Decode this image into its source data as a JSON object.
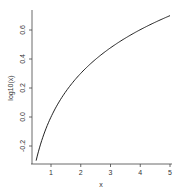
{
  "chart_data": {
    "type": "line",
    "title": "",
    "xlabel": "x",
    "ylabel": "log10(x)",
    "xlim": [
      0.5,
      5
    ],
    "ylim": [
      -0.301,
      0.699
    ],
    "x_ticks": [
      1,
      2,
      3,
      4,
      5
    ],
    "x_tick_labels": [
      "1",
      "2",
      "3",
      "4",
      "5"
    ],
    "y_ticks": [
      -0.2,
      0.0,
      0.2,
      0.4,
      0.6
    ],
    "y_tick_labels": [
      "-0.2",
      "0.0",
      "0.2",
      "0.4",
      "0.6"
    ],
    "grid": false,
    "legend": null,
    "series": [
      {
        "name": "log10(x)",
        "x": [
          0.5,
          0.6,
          0.7,
          0.8,
          0.9,
          1.0,
          1.25,
          1.5,
          1.75,
          2.0,
          2.5,
          3.0,
          3.5,
          4.0,
          4.5,
          5.0
        ],
        "values": [
          -0.301,
          -0.222,
          -0.155,
          -0.097,
          -0.046,
          0.0,
          0.097,
          0.176,
          0.243,
          0.301,
          0.398,
          0.477,
          0.544,
          0.602,
          0.653,
          0.699
        ]
      }
    ],
    "line_color": "#222222"
  },
  "axes": {
    "x_label": "x",
    "y_label": "log10(x)"
  }
}
